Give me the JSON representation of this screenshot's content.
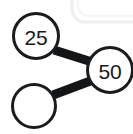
{
  "diagram": {
    "type": "number-bond-graph",
    "background_color": "#ffffff",
    "stroke_color": "#1a1b1d",
    "text_color": "#17181a",
    "node_fill": "#ffffff",
    "node_stroke_width": 3,
    "edge_stroke_width": 9,
    "nodes": [
      {
        "id": "node-25",
        "name": "node-top-left",
        "label": "25",
        "cx": 36,
        "cy": 36,
        "r": 23,
        "empty": false
      },
      {
        "id": "node-50",
        "name": "node-right",
        "label": "50",
        "cx": 110,
        "cy": 70,
        "r": 23,
        "empty": false
      },
      {
        "id": "node-blank",
        "name": "node-bottom-left",
        "label": "",
        "cx": 34,
        "cy": 106,
        "r": 22,
        "empty": true
      }
    ],
    "edges": [
      {
        "id": "edge-25-50",
        "name": "edge-top",
        "from": "node-25",
        "to": "node-50",
        "x1": 54,
        "y1": 50,
        "x2": 92,
        "y2": 62
      },
      {
        "id": "edge-blank-50",
        "name": "edge-bottom",
        "from": "node-blank",
        "to": "node-50",
        "x1": 53,
        "y1": 95,
        "x2": 93,
        "y2": 80
      }
    ]
  },
  "decorations": {
    "corner_card": {
      "name": "rounded-card-corner",
      "description": "faint light-gray rounded rectangle edge peeking in at top-right",
      "color_outer": "#f2f2f2",
      "color_inner": "#fbfbfb",
      "x": 72,
      "y": -26,
      "width": 72,
      "height": 48,
      "radius": 12
    }
  }
}
